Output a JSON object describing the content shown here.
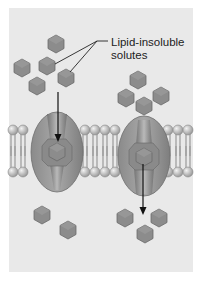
{
  "diagram": {
    "label": "Lipid-insoluble\nsolutes",
    "colors": {
      "background": "#e9e9e9",
      "solute": "#8c8c8c",
      "protein": "#9a9a9a",
      "phospholipid_head": "#bdbdbd",
      "arrow": "#111111"
    },
    "components": [
      "phospholipid bilayer",
      "channel protein (left)",
      "channel protein (right)",
      "solute molecules"
    ],
    "arrows": [
      {
        "protein": "left",
        "direction": "down",
        "meaning": "solute entering channel"
      },
      {
        "protein": "right",
        "direction": "down",
        "meaning": "solute exiting channel"
      }
    ]
  }
}
